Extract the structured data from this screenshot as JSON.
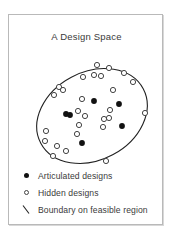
{
  "figure": {
    "title": "A Design Space",
    "background_color": "#ffffff",
    "panel_border_color": "#b9b9b9",
    "ink_color": "#111111",
    "outline_color": "#444444"
  },
  "legend": {
    "entries": [
      {
        "marker": "filled-dot-icon",
        "label": "Articulated designs"
      },
      {
        "marker": "hollow-circle-icon",
        "label": "Hidden designs"
      },
      {
        "marker": "diagonal-line-icon",
        "label": "Boundary on feasible region"
      }
    ]
  },
  "chart_data": {
    "type": "scatter",
    "title": "A Design Space",
    "xlabel": "",
    "ylabel": "",
    "grid": false,
    "legend_position": "below-plot",
    "xlim": [
      0,
      155
    ],
    "ylim": [
      0,
      150
    ],
    "annotations": [
      {
        "name": "feasible-region-boundary",
        "shape": "ellipse",
        "cx": 83,
        "cy": 101,
        "rx": 58,
        "ry": 44,
        "rotation_deg": -28,
        "stroke": "#222222",
        "fill": "none"
      }
    ],
    "series": [
      {
        "name": "Articulated designs",
        "marker": "filled-circle",
        "color": "#111111",
        "points": [
          [
            85,
            86
          ],
          [
            110,
            89
          ],
          [
            57,
            99
          ],
          [
            61,
            100
          ],
          [
            113,
            111
          ],
          [
            73,
            128
          ]
        ]
      },
      {
        "name": "Hidden designs",
        "marker": "open-circle",
        "color": "#ffffff",
        "edge_color": "#444444",
        "points": [
          [
            88,
            50
          ],
          [
            100,
            53
          ],
          [
            115,
            58
          ],
          [
            74,
            62
          ],
          [
            85,
            60
          ],
          [
            92,
            61
          ],
          [
            124,
            67
          ],
          [
            50,
            72
          ],
          [
            54,
            75
          ],
          [
            45,
            80
          ],
          [
            104,
            75
          ],
          [
            136,
            98
          ],
          [
            73,
            84
          ],
          [
            101,
            95
          ],
          [
            69,
            96
          ],
          [
            76,
            101
          ],
          [
            95,
            104
          ],
          [
            100,
            103
          ],
          [
            94,
            112
          ],
          [
            70,
            110
          ],
          [
            68,
            119
          ],
          [
            37,
            116
          ],
          [
            36,
            126
          ],
          [
            48,
            131
          ],
          [
            57,
            136
          ],
          [
            44,
            141
          ],
          [
            97,
            146
          ]
        ]
      }
    ]
  }
}
